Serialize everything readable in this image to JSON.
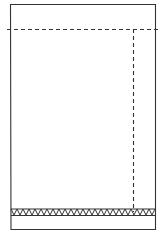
{
  "diagram": {
    "type": "line-drawing",
    "colors": {
      "background": "#ffffff",
      "stroke": "#333333"
    },
    "frame": {
      "x": 10,
      "y": 4,
      "width": 146,
      "height": 225
    },
    "dashed_horizontal": {
      "y": 29,
      "x1": 7,
      "x2": 158
    },
    "dashed_vertical": {
      "x": 133,
      "y1": 29,
      "y2": 212
    },
    "hatched_band": {
      "x1": 11,
      "x2": 156,
      "y_top": 209,
      "y_bottom": 215,
      "pattern": "zig-zag"
    },
    "labels": []
  }
}
